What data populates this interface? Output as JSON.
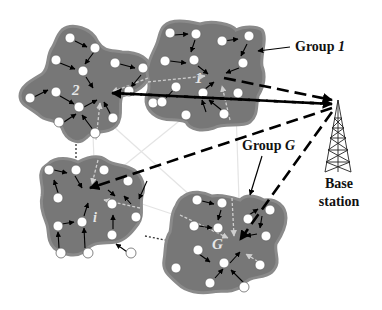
{
  "diagram": {
    "labels": {
      "group_1": "Group 1",
      "group_1_prefix": "Group ",
      "group_1_suffix": "1",
      "group_g_prefix": "Group ",
      "group_g_suffix": "G",
      "base_station_line1": "Base",
      "base_station_line2": "station"
    },
    "groups": [
      {
        "id": "2",
        "label": "2"
      },
      {
        "id": "1",
        "label": "1"
      },
      {
        "id": "i",
        "label": "i"
      },
      {
        "id": "G",
        "label": "G"
      }
    ],
    "colors": {
      "cluster_fill": "#777777",
      "cluster_edge": "#8c8c8c",
      "node_fill": "#ffffff",
      "arrow": "#000000",
      "intra_link": "#dddddd",
      "inter_link": "#e8e8e8"
    }
  }
}
